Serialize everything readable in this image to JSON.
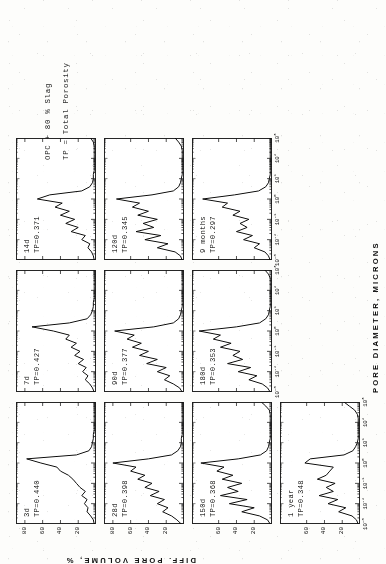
{
  "figure": {
    "y_axis_title": "DIFF. PORE VOLUME, %",
    "x_axis_title": "PORE DIAMETER, MICRONS",
    "note_line1": "OPC + 80 % Slag",
    "note_line2": "TP = Total Porosity",
    "rotation_degrees": "-90"
  },
  "axes": {
    "x_ticks": [
      "10-3",
      "10-2",
      "10-1",
      "100",
      "101",
      "102",
      "103"
    ],
    "x_tick_mantissa": "10",
    "x_tick_exponents": [
      "-3",
      "-2",
      "-1",
      "0",
      "1",
      "2",
      "3"
    ],
    "y_ticks_4": [
      "80",
      "60",
      "40",
      "20"
    ],
    "y_ticks_3": [
      "60",
      "40",
      "20"
    ],
    "x_range_log10": [
      -3,
      3
    ],
    "y_range": [
      0,
      90
    ]
  },
  "chart_data": {
    "type": "line",
    "xlabel": "PORE DIAMETER, MICRONS",
    "ylabel": "DIFF. PORE VOLUME, %",
    "xscale": "log",
    "xlim": [
      0.001,
      1000
    ],
    "ylim": [
      0,
      90
    ],
    "grid": false,
    "legend": "none",
    "annotations": [
      "OPC + 80 % Slag",
      "TP = Total Porosity"
    ],
    "panel_grid": {
      "rows": 4,
      "cols": 3,
      "note": "column 3 row 4 holds annotation text; panel order runs 3d,7d,14d / 28d,90d,120d / 150d,180d,9 months / 1 year"
    },
    "panels": [
      {
        "id": "p-3d",
        "age_label": "3d",
        "tp_label": "TP=0.440",
        "total_porosity": 0.44,
        "yticks": [
          "80",
          "60",
          "40",
          "20"
        ],
        "x": [
          0.001,
          0.0016,
          0.0025,
          0.004,
          0.0063,
          0.01,
          0.016,
          0.025,
          0.04,
          0.063,
          0.1,
          0.16,
          0.25,
          0.4,
          0.63,
          1.0,
          1.6,
          2.5,
          4.0,
          6.3,
          10,
          16,
          25,
          40,
          63,
          100,
          160,
          250,
          400,
          630,
          1000
        ],
        "y": [
          2,
          3,
          6,
          10,
          9,
          13,
          10,
          16,
          12,
          18,
          22,
          26,
          31,
          40,
          44,
          62,
          78,
          22,
          8,
          5,
          4,
          3,
          3,
          2,
          2,
          2,
          2,
          2,
          2,
          2,
          2
        ]
      },
      {
        "id": "p-7d",
        "age_label": "7d",
        "tp_label": "TP=0.427",
        "total_porosity": 0.427,
        "yticks": [
          "80",
          "60",
          "40",
          "20"
        ],
        "x": [
          0.001,
          0.0016,
          0.0025,
          0.004,
          0.0063,
          0.01,
          0.016,
          0.025,
          0.04,
          0.063,
          0.1,
          0.16,
          0.25,
          0.4,
          0.63,
          1.0,
          1.6,
          2.5,
          4.0,
          6.3,
          10,
          16,
          25,
          40,
          63,
          100,
          160,
          250,
          400,
          630,
          1000
        ],
        "y": [
          2,
          4,
          7,
          12,
          9,
          15,
          11,
          20,
          14,
          24,
          18,
          28,
          22,
          34,
          30,
          48,
          72,
          30,
          10,
          6,
          4,
          3,
          3,
          2,
          2,
          2,
          2,
          2,
          2,
          2,
          2
        ]
      },
      {
        "id": "p-14d",
        "age_label": "14d",
        "tp_label": "TP=0.371",
        "total_porosity": 0.371,
        "yticks": [
          "80",
          "60",
          "40",
          "20"
        ],
        "x": [
          0.001,
          0.0016,
          0.0025,
          0.004,
          0.0063,
          0.01,
          0.016,
          0.025,
          0.04,
          0.063,
          0.1,
          0.16,
          0.25,
          0.4,
          0.63,
          1.0,
          1.6,
          2.5,
          4.0,
          6.3,
          10,
          16,
          25,
          40,
          63,
          100,
          160,
          250,
          400,
          630,
          1000
        ],
        "y": [
          2,
          3,
          5,
          9,
          7,
          16,
          12,
          28,
          20,
          34,
          24,
          40,
          30,
          46,
          38,
          66,
          52,
          16,
          7,
          4,
          3,
          3,
          2,
          2,
          2,
          2,
          2,
          2,
          2,
          3,
          6
        ]
      },
      {
        "id": "p-28d",
        "age_label": "28d",
        "tp_label": "TP=0.398",
        "total_porosity": 0.398,
        "yticks": [
          "80",
          "60",
          "40",
          "20"
        ],
        "x": [
          0.001,
          0.0016,
          0.0025,
          0.004,
          0.0063,
          0.01,
          0.016,
          0.025,
          0.04,
          0.063,
          0.1,
          0.16,
          0.25,
          0.4,
          0.63,
          1.0,
          1.6,
          2.5,
          4.0,
          6.3,
          10,
          16,
          25,
          40,
          63,
          100,
          160,
          250,
          400,
          630,
          1000
        ],
        "y": [
          3,
          8,
          14,
          24,
          18,
          30,
          22,
          38,
          28,
          44,
          36,
          52,
          44,
          60,
          54,
          80,
          40,
          14,
          7,
          4,
          3,
          3,
          2,
          2,
          2,
          2,
          2,
          2,
          2,
          2,
          2
        ]
      },
      {
        "id": "p-90d",
        "age_label": "90d",
        "tp_label": "TP=0.377",
        "total_porosity": 0.377,
        "yticks": [
          "60",
          "40",
          "20"
        ],
        "x": [
          0.001,
          0.0016,
          0.0025,
          0.004,
          0.0063,
          0.01,
          0.016,
          0.025,
          0.04,
          0.063,
          0.1,
          0.16,
          0.25,
          0.4,
          0.63,
          1.0,
          1.6,
          2.5,
          4.0,
          6.3,
          10,
          16,
          25,
          40,
          63,
          100,
          160,
          250,
          400,
          630,
          1000
        ],
        "y": [
          2,
          5,
          12,
          22,
          16,
          30,
          20,
          42,
          30,
          50,
          40,
          58,
          48,
          64,
          56,
          78,
          34,
          12,
          6,
          4,
          3,
          2,
          2,
          2,
          2,
          2,
          2,
          2,
          2,
          2,
          2
        ]
      },
      {
        "id": "p-120d",
        "age_label": "120d",
        "tp_label": "TP=0.345",
        "total_porosity": 0.345,
        "yticks": [
          "60",
          "40",
          "20"
        ],
        "x": [
          0.001,
          0.0016,
          0.0025,
          0.004,
          0.0063,
          0.01,
          0.016,
          0.025,
          0.04,
          0.063,
          0.1,
          0.16,
          0.25,
          0.4,
          0.63,
          1.0,
          1.6,
          2.5,
          4.0,
          6.3,
          10,
          16,
          25,
          40,
          63,
          100,
          160,
          250,
          400,
          630,
          1000
        ],
        "y": [
          2,
          4,
          10,
          30,
          18,
          44,
          26,
          54,
          34,
          46,
          30,
          52,
          40,
          58,
          50,
          76,
          36,
          12,
          6,
          4,
          3,
          2,
          2,
          2,
          2,
          2,
          2,
          2,
          3,
          6,
          10
        ]
      },
      {
        "id": "p-150d",
        "age_label": "150d",
        "tp_label": "TP=0.368",
        "total_porosity": 0.368,
        "yticks": [
          "60",
          "40",
          "20"
        ],
        "x": [
          0.001,
          0.0016,
          0.0025,
          0.004,
          0.0063,
          0.01,
          0.016,
          0.025,
          0.04,
          0.063,
          0.1,
          0.16,
          0.25,
          0.4,
          0.63,
          1.0,
          1.6,
          2.5,
          4.0,
          6.3,
          10,
          16,
          25,
          40,
          63,
          100,
          160,
          250,
          400,
          630,
          1000
        ],
        "y": [
          2,
          5,
          14,
          34,
          20,
          48,
          28,
          58,
          38,
          50,
          34,
          56,
          44,
          62,
          54,
          80,
          38,
          13,
          6,
          4,
          3,
          2,
          2,
          2,
          2,
          2,
          2,
          2,
          3,
          7,
          12
        ]
      },
      {
        "id": "p-180d",
        "age_label": "180d",
        "tp_label": "TP=0.353",
        "total_porosity": 0.353,
        "yticks": [
          "60",
          "40",
          "20"
        ],
        "x": [
          0.001,
          0.0016,
          0.0025,
          0.004,
          0.0063,
          0.01,
          0.016,
          0.025,
          0.04,
          0.063,
          0.1,
          0.16,
          0.25,
          0.4,
          0.63,
          1.0,
          1.6,
          2.5,
          4.0,
          6.3,
          10,
          16,
          25,
          40,
          63,
          100,
          160,
          250,
          400,
          630,
          1000
        ],
        "y": [
          2,
          5,
          11,
          26,
          17,
          38,
          24,
          50,
          33,
          44,
          36,
          58,
          46,
          66,
          58,
          82,
          40,
          14,
          7,
          4,
          3,
          2,
          2,
          2,
          2,
          2,
          2,
          2,
          2,
          4,
          8
        ]
      },
      {
        "id": "p-9months",
        "age_label": "9 months",
        "tp_label": "TP=0.297",
        "total_porosity": 0.297,
        "yticks": [
          "60",
          "40",
          "20"
        ],
        "x": [
          0.001,
          0.0016,
          0.0025,
          0.004,
          0.0063,
          0.01,
          0.016,
          0.025,
          0.04,
          0.063,
          0.1,
          0.16,
          0.25,
          0.4,
          0.63,
          1.0,
          1.6,
          2.5,
          4.0,
          6.3,
          10,
          16,
          25,
          40,
          63,
          100,
          160,
          250,
          400,
          630,
          1000
        ],
        "y": [
          2,
          4,
          8,
          20,
          14,
          32,
          22,
          40,
          28,
          36,
          26,
          44,
          36,
          56,
          50,
          78,
          42,
          15,
          7,
          4,
          3,
          2,
          2,
          2,
          2,
          2,
          2,
          2,
          2,
          2,
          2
        ]
      },
      {
        "id": "p-1year",
        "age_label": "1 year",
        "tp_label": "TP=0.348",
        "total_porosity": 0.348,
        "yticks": [
          "60",
          "40",
          "20"
        ],
        "x": [
          0.001,
          0.0016,
          0.0025,
          0.004,
          0.0063,
          0.01,
          0.016,
          0.025,
          0.04,
          0.063,
          0.1,
          0.16,
          0.25,
          0.4,
          0.63,
          1.0,
          1.6,
          2.5,
          4.0,
          6.3,
          10,
          16,
          25,
          40,
          63,
          100,
          160,
          250,
          400,
          630,
          1000
        ],
        "y": [
          2,
          4,
          9,
          24,
          16,
          36,
          25,
          46,
          30,
          38,
          28,
          48,
          38,
          34,
          30,
          62,
          56,
          18,
          8,
          5,
          3,
          2,
          2,
          2,
          2,
          2,
          2,
          3,
          6,
          12,
          18
        ]
      }
    ]
  }
}
